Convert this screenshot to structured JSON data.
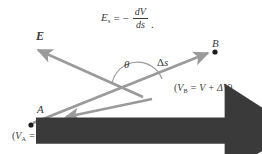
{
  "figure": {
    "background": "#ffffff",
    "stroke_color": "#9a9a9a",
    "text_color": "#3a3a3a",
    "width": 262,
    "height": 154
  },
  "formula": {
    "lhs_symbol": "E",
    "lhs_subscript": "s",
    "equals": "=",
    "minus": "−",
    "numerator": "dV",
    "denominator": "ds",
    "trailing_punctuation": "."
  },
  "labels": {
    "field_vector": "E",
    "angle": "θ",
    "displacement": "Δs",
    "point_b": "B",
    "potential_b": "(VB = V + ΔV)",
    "potential_b_symbol": "V",
    "potential_b_subscript": "B",
    "potential_b_rhs": "= V + ΔV)",
    "point_a": "A",
    "potential_a_symbol": "V",
    "potential_a_subscript": "A",
    "potential_a_rhs": "= V)",
    "e_one_symbol": "E",
    "e_one_subscript": "1",
    "open_paren": "(",
    "delta": "Δ"
  },
  "geometry": {
    "e_vector": {
      "from": [
        140,
        95
      ],
      "to": [
        33,
        47
      ],
      "arrow": "tip-at-to"
    },
    "ds_vector": {
      "from": [
        108,
        120
      ],
      "to": [
        212,
        50
      ],
      "arrow": "tip-at-to"
    },
    "e1_vector": {
      "from": [
        150,
        100
      ],
      "to": [
        60,
        118
      ],
      "arrow": "tip-at-to"
    },
    "point_a_dot": [
      31,
      124
    ],
    "point_b_dot": [
      215,
      52
    ],
    "angle_arc_center": [
      139,
      95
    ]
  }
}
